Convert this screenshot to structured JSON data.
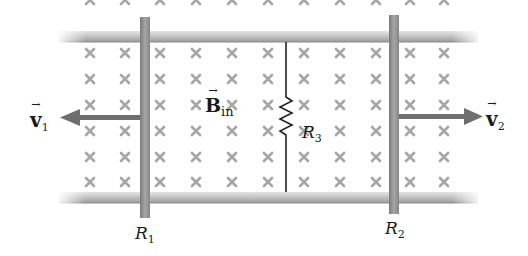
{
  "diagram": {
    "type": "physics-circuit",
    "field": {
      "label_base": "B",
      "label_sub": "in",
      "symbol": "×",
      "direction": "into-page"
    },
    "rod_left": {
      "label_base": "R",
      "label_sub": "1"
    },
    "rod_right": {
      "label_base": "R",
      "label_sub": "2"
    },
    "resistor": {
      "label_base": "R",
      "label_sub": "3"
    },
    "velocity_left": {
      "label_base": "v",
      "label_sub": "1",
      "direction": "left"
    },
    "velocity_right": {
      "label_base": "v",
      "label_sub": "2",
      "direction": "right"
    },
    "colors": {
      "rail": "#b8b8b8",
      "rod": "#8c8c8c",
      "x_mark": "#a8a8a8",
      "arrow": "#6e6e6e",
      "wire": "#222222"
    }
  }
}
